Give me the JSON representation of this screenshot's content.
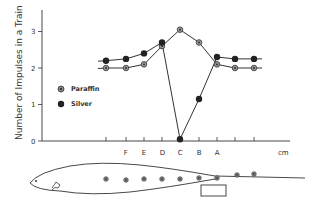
{
  "chart_data": {
    "type": "line",
    "title": "",
    "ylabel": "Number of Impulses in a Train",
    "xlabel": "cm",
    "ylim": [
      0,
      3.5
    ],
    "yticks": [
      "0",
      "1",
      "2",
      "3"
    ],
    "categories": [
      "",
      "F",
      "E",
      "D",
      "C",
      "B",
      "A",
      "",
      ""
    ],
    "grid": false,
    "legend_position": "left-middle",
    "series": [
      {
        "name": "Paraffin",
        "marker": "dotted-circle",
        "values": [
          2.0,
          2.0,
          2.1,
          2.6,
          3.05,
          2.7,
          2.1,
          2.0,
          2.0
        ]
      },
      {
        "name": "Silver",
        "marker": "filled-circle",
        "values": [
          2.2,
          2.25,
          2.4,
          2.7,
          0.05,
          1.15,
          2.3,
          2.25,
          2.25
        ]
      }
    ],
    "annotations": [
      "Fish outline diagram below axis with electrode positions and a rectangular object under position B-A"
    ]
  },
  "axis": {
    "y_label": "Number of Impulses in a Train",
    "y_ticks": [
      "0",
      "1",
      "2",
      "3"
    ],
    "x_labels": [
      "",
      "F",
      "E",
      "D",
      "C",
      "B",
      "A",
      "",
      ""
    ],
    "x_unit": "cm"
  },
  "legend": {
    "paraffin": "Paraffin",
    "silver": "Silver"
  }
}
